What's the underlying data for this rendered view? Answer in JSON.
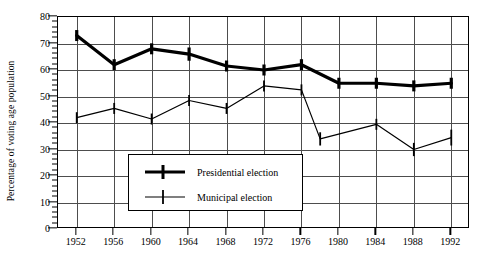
{
  "chart_data": {
    "type": "line",
    "title": "",
    "xlabel": "",
    "ylabel": "Percentage of voting age population",
    "x": [
      1952,
      1956,
      1960,
      1964,
      1968,
      1972,
      1976,
      1980,
      1984,
      1988,
      1992
    ],
    "xlim": [
      1950,
      1994
    ],
    "ylim": [
      0,
      80
    ],
    "ytick_labels": [
      "0",
      "10",
      "20",
      "30",
      "40",
      "50",
      "60",
      "70",
      "80"
    ],
    "ytick_values": [
      0,
      10,
      20,
      30,
      40,
      50,
      60,
      70,
      80
    ],
    "xtick_labels": [
      "1952",
      "1956",
      "1960",
      "1964",
      "1968",
      "1972",
      "1976",
      "1980",
      "1984",
      "1988",
      "1992"
    ],
    "grid": true,
    "legend_position": "center",
    "series": [
      {
        "name": "Presidential election",
        "style": "thick",
        "x": [
          1952,
          1956,
          1960,
          1964,
          1968,
          1972,
          1976,
          1980,
          1984,
          1988,
          1992
        ],
        "values": [
          73,
          62,
          68,
          66,
          61.5,
          60,
          62,
          55,
          55,
          54,
          55
        ],
        "errorbars": [
          1.5,
          1.5,
          1.5,
          2.5,
          1.5,
          1.5,
          1.5,
          1.5,
          1.5,
          1.5,
          1.5
        ]
      },
      {
        "name": "Municipal election",
        "style": "thin",
        "x": [
          1952,
          1956,
          1960,
          1964,
          1968,
          1972,
          1976,
          1978,
          1984,
          1988,
          1992
        ],
        "values": [
          42,
          45.5,
          41.5,
          48.5,
          45.5,
          54,
          52.5,
          34,
          39.5,
          30,
          34.5
        ],
        "errorbars": [
          2.0,
          2.0,
          2.0,
          2.0,
          2.0,
          2.0,
          2.0,
          2.5,
          2.0,
          2.5,
          3.0
        ]
      }
    ]
  },
  "legend": {
    "items": [
      {
        "label": "Presidential election",
        "style": "thick"
      },
      {
        "label": "Municipal election",
        "style": "thin"
      }
    ]
  }
}
